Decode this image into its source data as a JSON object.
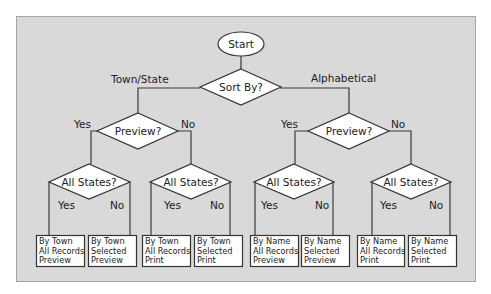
{
  "diagram": {
    "start": "Start",
    "sort_decision": "Sort By?",
    "branch_left": "Town/State",
    "branch_right": "Alphabetical",
    "preview_decision": "Preview?",
    "states_decision": "All States?",
    "yes": "Yes",
    "no": "No",
    "outcomes": [
      [
        "By Town",
        "All Records",
        "Preview"
      ],
      [
        "By Town",
        "Selected",
        "Preview"
      ],
      [
        "By Town",
        "All Records",
        "Print"
      ],
      [
        "By Town",
        "Selected",
        "Print"
      ],
      [
        "By Name",
        "All Records",
        "Preview"
      ],
      [
        "By Name",
        "Selected",
        "Preview"
      ],
      [
        "By Name",
        "All Records",
        "Print"
      ],
      [
        "By Name",
        "Selected",
        "Print"
      ]
    ]
  },
  "colors": {
    "panel": "#d9d9d9",
    "shape_fill": "#ffffff",
    "stroke": "#333333"
  }
}
